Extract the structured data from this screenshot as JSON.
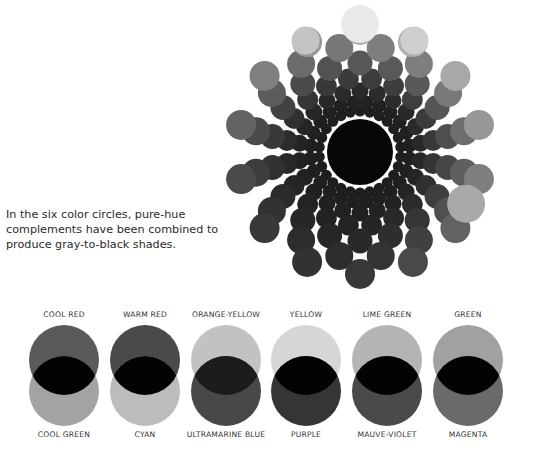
{
  "caption": {
    "lines": [
      "In the six color circles, pure-hue",
      "complements have been combined to",
      "produce gray-to-black shades."
    ]
  },
  "mandala": {
    "center": [
      360,
      152
    ],
    "core": {
      "radius": 33,
      "color": "#060606"
    },
    "rings": [
      {
        "radius": 41,
        "count": 26,
        "size": 5.5
      },
      {
        "radius": 50,
        "count": 24,
        "size": 7
      },
      {
        "radius": 61,
        "count": 22,
        "size": 8.5
      },
      {
        "radius": 74,
        "count": 20,
        "size": 10.5
      },
      {
        "radius": 89,
        "count": 18,
        "size": 12.5
      },
      {
        "radius": 106,
        "count": 16,
        "size": 14
      },
      {
        "radius": 122,
        "count": 14,
        "size": 15
      }
    ],
    "outer_highlights": [
      {
        "angle": -90,
        "radius": 128,
        "size": 19,
        "color": "#e9e9e9"
      },
      {
        "angle": -64,
        "radius": 124,
        "size": 14,
        "color": "#cfcfcf"
      },
      {
        "angle": -116,
        "radius": 124,
        "size": 14,
        "color": "#c4c4c4"
      },
      {
        "angle": 26,
        "radius": 118,
        "size": 19,
        "color": "#a9a9a9"
      }
    ]
  },
  "pairs": [
    {
      "top_label": "COOL RED",
      "bottom_label": "COOL GREEN",
      "top_color": "#5a5a5a",
      "bottom_color": "#a3a3a3",
      "overlap_color": "#030303",
      "x": 22
    },
    {
      "top_label": "WARM RED",
      "bottom_label": "CYAN",
      "top_color": "#4a4a4a",
      "bottom_color": "#bcbcbc",
      "overlap_color": "#030303",
      "x": 103
    },
    {
      "top_label": "ORANGE-YELLOW",
      "bottom_label": "ULTRAMARINE BLUE",
      "top_color": "#c2c2c2",
      "bottom_color": "#484848",
      "overlap_color": "#1c1c1c",
      "x": 184
    },
    {
      "top_label": "YELLOW",
      "bottom_label": "PURPLE",
      "top_color": "#d6d6d6",
      "bottom_color": "#353535",
      "overlap_color": "#030303",
      "x": 264
    },
    {
      "top_label": "LIME GREEN",
      "bottom_label": "MAUVE-VIOLET",
      "top_color": "#b4b4b4",
      "bottom_color": "#4a4a4a",
      "overlap_color": "#030303",
      "x": 345
    },
    {
      "top_label": "GREEN",
      "bottom_label": "MAGENTA",
      "top_color": "#a1a1a1",
      "bottom_color": "#6a6a6a",
      "overlap_color": "#030303",
      "x": 426
    }
  ]
}
